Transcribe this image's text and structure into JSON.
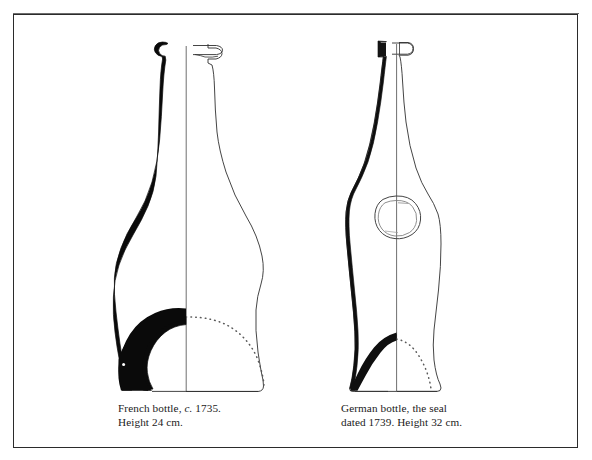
{
  "plate": {
    "background_color": "#ffffff",
    "ink_color": "#111111",
    "frame_color": "#2b2b2b",
    "width": 592,
    "height": 460,
    "description": "Two antique glass bottles drawn in half-section profile, black sectioned left half and thin outlined right half, with dotted interior base lines"
  },
  "figures": [
    {
      "id": "french-bottle",
      "name": "French bottle",
      "caption_line_1_before_italic": "French bottle, ",
      "caption_line_1_italic": "c.",
      "caption_line_1_after_italic": " 1735.",
      "caption_line_2": "Height 24 cm.",
      "origin": "French",
      "circa": "c. 1735",
      "height": "24 cm",
      "has_seal": false,
      "form": "tall onion-shouldered bottle with long tapering neck and string rim"
    },
    {
      "id": "german-bottle",
      "name": "German bottle",
      "caption_line_1_before_italic": "German bottle, the seal",
      "caption_line_1_italic": "",
      "caption_line_1_after_italic": "",
      "caption_line_2": "dated 1739. Height 32 cm.",
      "origin": "German",
      "seal_date": "1739",
      "height": "32 cm",
      "has_seal": true,
      "form": "angular shouldered bottle with applied glass seal at widest point"
    }
  ]
}
